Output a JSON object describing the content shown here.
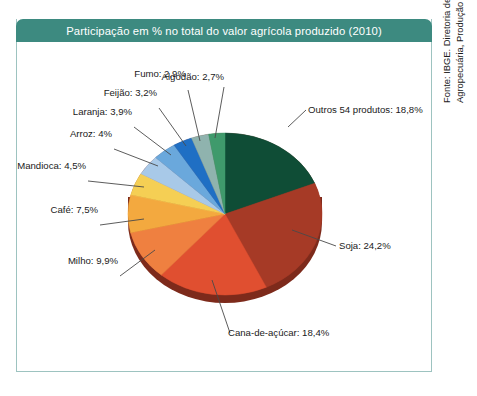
{
  "title": "Participação em % no total do valor agrícola produzido (2010)",
  "source_note": "Fonte: IBGE. Diretoria de Pesquisas, Coordenação de Agropecuária, Produção Agrícola Municipal, 2010.",
  "theme": {
    "header_bg": "#3d8a80",
    "header_text": "#ffffff",
    "frame_border": "#9dc3c0",
    "page_bg": "#ffffff",
    "label_text": "#1a1a1a",
    "leader_line": "#4a4a4a"
  },
  "chart_data": {
    "type": "pie",
    "title": "Participação em % no total do valor agrícola produzido (2010)",
    "unit": "%",
    "legend": "none",
    "labels_inline": true,
    "categories": [
      "Outros 54 produtos",
      "Soja",
      "Cana-de-açúcar",
      "Milho",
      "Café",
      "Mandioca",
      "Arroz",
      "Laranja",
      "Feijão",
      "Fumo",
      "Algodão"
    ],
    "values": [
      18.8,
      24.2,
      18.4,
      9.9,
      7.5,
      4.5,
      4,
      3.9,
      3.2,
      2.9,
      2.7
    ],
    "value_labels": [
      "18,8%",
      "24,2%",
      "18,4%",
      "9,9%",
      "7,5%",
      "4,5%",
      "4%",
      "3,9%",
      "3,2%",
      "2,9%",
      "2,7%"
    ],
    "colors": [
      "#0f4d36",
      "#a63a26",
      "#e04f30",
      "#ef8040",
      "#f3a93f",
      "#f5cf54",
      "#a8c9e8",
      "#6aa8dc",
      "#1f6fc4",
      "#8fb3ae",
      "#3f9a6c"
    ],
    "slices": [
      {
        "name": "Outros 54 produtos",
        "value": 18.8,
        "label": "Outros 54 produtos: 18,8%",
        "color": "#0f4d36"
      },
      {
        "name": "Soja",
        "value": 24.2,
        "label": "Soja: 24,2%",
        "color": "#a63a26"
      },
      {
        "name": "Cana-de-açúcar",
        "value": 18.4,
        "label": "Cana-de-açúcar: 18,4%",
        "color": "#e04f30"
      },
      {
        "name": "Milho",
        "value": 9.9,
        "label": "Milho: 9,9%",
        "color": "#ef8040"
      },
      {
        "name": "Café",
        "value": 7.5,
        "label": "Café: 7,5%",
        "color": "#f3a93f"
      },
      {
        "name": "Mandioca",
        "value": 4.5,
        "label": "Mandioca: 4,5%",
        "color": "#f5cf54"
      },
      {
        "name": "Arroz",
        "value": 4,
        "label": "Arroz: 4%",
        "color": "#a8c9e8"
      },
      {
        "name": "Laranja",
        "value": 3.9,
        "label": "Laranja: 3,9%",
        "color": "#6aa8dc"
      },
      {
        "name": "Feijão",
        "value": 3.2,
        "label": "Feijão: 3,2%",
        "color": "#1f6fc4"
      },
      {
        "name": "Fumo",
        "value": 2.9,
        "label": "Fumo: 2,9%",
        "color": "#8fb3ae"
      },
      {
        "name": "Algodão",
        "value": 2.7,
        "label": "Algodão: 2,7%",
        "color": "#3f9a6c"
      }
    ]
  },
  "labels": {
    "outros": "Outros 54 produtos: 18,8%",
    "soja": "Soja: 24,2%",
    "cana": "Cana-de-açúcar: 18,4%",
    "milho": "Milho: 9,9%",
    "cafe": "Café: 7,5%",
    "mandioca": "Mandioca: 4,5%",
    "arroz": "Arroz: 4%",
    "laranja": "Laranja: 3,9%",
    "feijao": "Feijão: 3,2%",
    "fumo": "Fumo: 2,9%",
    "algodao": "Algodão: 2,7%"
  }
}
